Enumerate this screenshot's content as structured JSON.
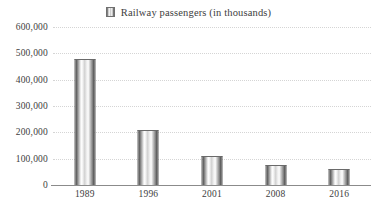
{
  "legend": {
    "swatch_icon": "bar-series-swatch",
    "label": "Railway passengers (in thousands)"
  },
  "axes": {
    "y_ticks": [
      "600,000",
      "500,000",
      "400,000",
      "300,000",
      "200,000",
      "100,000",
      "0"
    ],
    "x_ticks": [
      "1989",
      "1996",
      "2001",
      "2008",
      "2016"
    ]
  },
  "colors": {
    "gridline": "#d5d5d5",
    "axis": "#8b8b8b",
    "text": "#3d3d3d",
    "bar_dark": "#4a4a4a",
    "bar_light": "#ffffff",
    "background": "#ffffff"
  },
  "chart_data": {
    "type": "bar",
    "title": "",
    "categories": [
      "1989",
      "1996",
      "2001",
      "2008",
      "2016"
    ],
    "values": [
      480000,
      210000,
      110000,
      77000,
      62000
    ],
    "series": [
      {
        "name": "Railway passengers (in thousands)",
        "values": [
          480000,
          210000,
          110000,
          77000,
          62000
        ]
      }
    ],
    "xlabel": "",
    "ylabel": "",
    "ylim": [
      0,
      600000
    ],
    "ytick_values": [
      0,
      100000,
      200000,
      300000,
      400000,
      500000,
      600000
    ],
    "grid": true,
    "grid_style": "dotted-horizontal",
    "legend": "top-center"
  }
}
